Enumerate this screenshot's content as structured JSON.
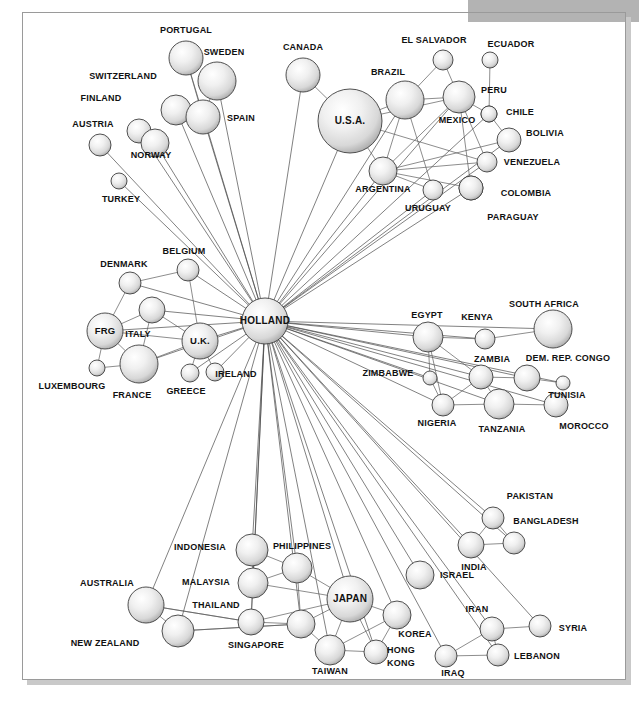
{
  "figure": {
    "type": "network-diagram",
    "title": "",
    "hub": "HOLLAND",
    "background": "#ffffff",
    "frame_color": "#9a9a9a",
    "banner_color": "#b3b3b3",
    "node_fill_light": "#ffffff",
    "node_fill_mid": "#e2e2e2",
    "node_fill_dark": "#b0b0b0",
    "node_stroke": "#3d3d3d",
    "edge_color": "#5c5c5c"
  },
  "banner": {
    "x": 468,
    "y": 0,
    "width": 171,
    "height": 22
  },
  "frame": {
    "x": 22,
    "y": 12,
    "width": 604,
    "height": 668
  },
  "nodes": [
    {
      "id": "portugal",
      "label": "PORTUGAL",
      "x": 186,
      "y": 58,
      "r": 17,
      "lx": 186,
      "ly": 33,
      "anchor": "middle",
      "inside": false
    },
    {
      "id": "sweden",
      "label": "SWEDEN",
      "x": 217,
      "y": 81,
      "r": 19,
      "lx": 224,
      "ly": 55,
      "anchor": "middle",
      "inside": false
    },
    {
      "id": "switzerland",
      "label": "SWITZERLAND",
      "x": 176,
      "y": 110,
      "r": 15,
      "lx": 123,
      "ly": 79,
      "anchor": "middle",
      "inside": false
    },
    {
      "id": "spain",
      "label": "SPAIN",
      "x": 203,
      "y": 117,
      "r": 17,
      "lx": 241,
      "ly": 121,
      "anchor": "middle",
      "inside": false
    },
    {
      "id": "finland",
      "label": "FINLAND",
      "x": 139,
      "y": 131,
      "r": 12,
      "lx": 101,
      "ly": 101,
      "anchor": "middle",
      "inside": false
    },
    {
      "id": "norway",
      "label": "NORWAY",
      "x": 155,
      "y": 143,
      "r": 14,
      "lx": 151,
      "ly": 158,
      "anchor": "middle",
      "inside": false
    },
    {
      "id": "austria",
      "label": "AUSTRIA",
      "x": 100,
      "y": 145,
      "r": 11,
      "lx": 93,
      "ly": 127,
      "anchor": "middle",
      "inside": false
    },
    {
      "id": "turkey",
      "label": "TURKEY",
      "x": 119,
      "y": 181,
      "r": 8,
      "lx": 121,
      "ly": 202,
      "anchor": "middle",
      "inside": false
    },
    {
      "id": "canada",
      "label": "CANADA",
      "x": 303,
      "y": 75,
      "r": 17,
      "lx": 303,
      "ly": 50,
      "anchor": "middle",
      "inside": false
    },
    {
      "id": "usa",
      "label": "U.S.A.",
      "x": 350,
      "y": 121,
      "r": 32,
      "lx": 350,
      "ly": 124,
      "anchor": "middle",
      "inside": true
    },
    {
      "id": "brazil",
      "label": "BRAZIL",
      "x": 405,
      "y": 100,
      "r": 19,
      "lx": 388,
      "ly": 75,
      "anchor": "middle",
      "inside": false
    },
    {
      "id": "elsalvador",
      "label": "EL SALVADOR",
      "x": 443,
      "y": 60,
      "r": 10,
      "lx": 434,
      "ly": 43,
      "anchor": "middle",
      "inside": false
    },
    {
      "id": "ecuador",
      "label": "ECUADOR",
      "x": 490,
      "y": 60,
      "r": 8,
      "lx": 511,
      "ly": 47,
      "anchor": "middle",
      "inside": false
    },
    {
      "id": "mexico",
      "label": "MEXICO",
      "x": 459,
      "y": 97,
      "r": 16,
      "lx": 457,
      "ly": 123,
      "anchor": "middle",
      "inside": false
    },
    {
      "id": "peru",
      "label": "PERU",
      "x": 489,
      "y": 114,
      "r": 8,
      "lx": 494,
      "ly": 93,
      "anchor": "middle",
      "inside": false
    },
    {
      "id": "chile",
      "label": "CHILE",
      "x": 489,
      "y": 114,
      "r": 8,
      "lx": 520,
      "ly": 115,
      "anchor": "middle",
      "inside": false
    },
    {
      "id": "bolivia",
      "label": "BOLIVIA",
      "x": 509,
      "y": 140,
      "r": 12,
      "lx": 545,
      "ly": 136,
      "anchor": "middle",
      "inside": false
    },
    {
      "id": "argentina",
      "label": "ARGENTINA",
      "x": 383,
      "y": 171,
      "r": 14,
      "lx": 383,
      "ly": 192,
      "anchor": "middle",
      "inside": false
    },
    {
      "id": "venezuela",
      "label": "VENEZUELA",
      "x": 487,
      "y": 162,
      "r": 10,
      "lx": 532,
      "ly": 165,
      "anchor": "middle",
      "inside": false
    },
    {
      "id": "uruguay",
      "label": "URUGUAY",
      "x": 433,
      "y": 190,
      "r": 10,
      "lx": 428,
      "ly": 211,
      "anchor": "middle",
      "inside": false
    },
    {
      "id": "paraguay",
      "label": "PARAGUAY",
      "x": 471,
      "y": 188,
      "r": 12,
      "lx": 513,
      "ly": 220,
      "anchor": "middle",
      "inside": false
    },
    {
      "id": "colombia",
      "label": "COLOMBIA",
      "x": 471,
      "y": 188,
      "r": 12,
      "lx": 526,
      "ly": 196,
      "anchor": "middle",
      "inside": false
    },
    {
      "id": "belgium",
      "label": "BELGIUM",
      "x": 188,
      "y": 270,
      "r": 11,
      "lx": 184,
      "ly": 254,
      "anchor": "middle",
      "inside": false
    },
    {
      "id": "denmark",
      "label": "DENMARK",
      "x": 130,
      "y": 283,
      "r": 11,
      "lx": 124,
      "ly": 267,
      "anchor": "middle",
      "inside": false
    },
    {
      "id": "italy",
      "label": "ITALY",
      "x": 152,
      "y": 310,
      "r": 13,
      "lx": 138,
      "ly": 337,
      "anchor": "middle",
      "inside": false
    },
    {
      "id": "frg",
      "label": "FRG",
      "x": 105,
      "y": 331,
      "r": 18,
      "lx": 105,
      "ly": 334,
      "anchor": "middle",
      "inside": true
    },
    {
      "id": "uk",
      "label": "U.K.",
      "x": 200,
      "y": 341,
      "r": 18,
      "lx": 200,
      "ly": 344,
      "anchor": "middle",
      "inside": true
    },
    {
      "id": "holland",
      "label": "HOLLAND",
      "x": 265,
      "y": 321,
      "r": 23,
      "lx": 265,
      "ly": 324,
      "anchor": "middle",
      "inside": true
    },
    {
      "id": "france",
      "label": "FRANCE",
      "x": 139,
      "y": 364,
      "r": 19,
      "lx": 132,
      "ly": 398,
      "anchor": "middle",
      "inside": false
    },
    {
      "id": "luxembourg",
      "label": "LUXEMBOURG",
      "x": 97,
      "y": 368,
      "r": 8,
      "lx": 72,
      "ly": 389,
      "anchor": "middle",
      "inside": false
    },
    {
      "id": "greece",
      "label": "GREECE",
      "x": 190,
      "y": 373,
      "r": 9,
      "lx": 186,
      "ly": 394,
      "anchor": "middle",
      "inside": false
    },
    {
      "id": "ireland",
      "label": "IRELAND",
      "x": 215,
      "y": 372,
      "r": 9,
      "lx": 236,
      "ly": 377,
      "anchor": "middle",
      "inside": false
    },
    {
      "id": "egypt",
      "label": "EGYPT",
      "x": 428,
      "y": 337,
      "r": 15,
      "lx": 427,
      "ly": 318,
      "anchor": "middle",
      "inside": false
    },
    {
      "id": "kenya",
      "label": "KENYA",
      "x": 485,
      "y": 339,
      "r": 10,
      "lx": 477,
      "ly": 320,
      "anchor": "middle",
      "inside": false
    },
    {
      "id": "southafrica",
      "label": "SOUTH AFRICA",
      "x": 553,
      "y": 329,
      "r": 19,
      "lx": 544,
      "ly": 307,
      "anchor": "middle",
      "inside": false
    },
    {
      "id": "zambia",
      "label": "ZAMBIA",
      "x": 481,
      "y": 377,
      "r": 12,
      "lx": 492,
      "ly": 362,
      "anchor": "middle",
      "inside": false
    },
    {
      "id": "congo",
      "label": "DEM. REP. CONGO",
      "x": 527,
      "y": 378,
      "r": 13,
      "lx": 568,
      "ly": 361,
      "anchor": "middle",
      "inside": false
    },
    {
      "id": "zimbabwe",
      "label": "ZIMBABWE",
      "x": 430,
      "y": 378,
      "r": 7,
      "lx": 388,
      "ly": 376,
      "anchor": "middle",
      "inside": false
    },
    {
      "id": "tunisia",
      "label": "TUNISIA",
      "x": 563,
      "y": 383,
      "r": 7,
      "lx": 567,
      "ly": 398,
      "anchor": "middle",
      "inside": false
    },
    {
      "id": "nigeria",
      "label": "NIGERIA",
      "x": 443,
      "y": 405,
      "r": 11,
      "lx": 437,
      "ly": 426,
      "anchor": "middle",
      "inside": false
    },
    {
      "id": "tanzania",
      "label": "TANZANIA",
      "x": 499,
      "y": 404,
      "r": 15,
      "lx": 502,
      "ly": 432,
      "anchor": "middle",
      "inside": false
    },
    {
      "id": "morocco",
      "label": "MOROCCO",
      "x": 556,
      "y": 405,
      "r": 12,
      "lx": 584,
      "ly": 429,
      "anchor": "middle",
      "inside": false
    },
    {
      "id": "indonesia",
      "label": "INDONESIA",
      "x": 252,
      "y": 550,
      "r": 16,
      "lx": 200,
      "ly": 550,
      "anchor": "middle",
      "inside": false
    },
    {
      "id": "philippines",
      "label": "PHILIPPINES",
      "x": 297,
      "y": 568,
      "r": 15,
      "lx": 302,
      "ly": 549,
      "anchor": "middle",
      "inside": false
    },
    {
      "id": "malaysia",
      "label": "MALAYSIA",
      "x": 253,
      "y": 583,
      "r": 15,
      "lx": 206,
      "ly": 585,
      "anchor": "middle",
      "inside": false
    },
    {
      "id": "japan",
      "label": "JAPAN",
      "x": 350,
      "y": 599,
      "r": 23,
      "lx": 350,
      "ly": 602,
      "anchor": "middle",
      "inside": true
    },
    {
      "id": "australia",
      "label": "AUSTRALIA",
      "x": 146,
      "y": 605,
      "r": 18,
      "lx": 107,
      "ly": 586,
      "anchor": "middle",
      "inside": false
    },
    {
      "id": "thailand",
      "label": "THAILAND",
      "x": 251,
      "y": 622,
      "r": 13,
      "lx": 216,
      "ly": 608,
      "anchor": "middle",
      "inside": false
    },
    {
      "id": "newzealand",
      "label": "NEW ZEALAND",
      "x": 178,
      "y": 631,
      "r": 16,
      "lx": 105,
      "ly": 646,
      "anchor": "middle",
      "inside": false
    },
    {
      "id": "singapore",
      "label": "SINGAPORE",
      "x": 301,
      "y": 624,
      "r": 14,
      "lx": 256,
      "ly": 648,
      "anchor": "middle",
      "inside": false
    },
    {
      "id": "taiwan",
      "label": "TAIWAN",
      "x": 330,
      "y": 650,
      "r": 15,
      "lx": 330,
      "ly": 674,
      "anchor": "middle",
      "inside": false
    },
    {
      "id": "korea",
      "label": "KOREA",
      "x": 397,
      "y": 615,
      "r": 14,
      "lx": 415,
      "ly": 637,
      "anchor": "middle",
      "inside": false
    },
    {
      "id": "hongkong",
      "label": "HONG",
      "x": 376,
      "y": 652,
      "r": 12,
      "lx": 401,
      "ly": 653,
      "anchor": "middle",
      "inside": false
    },
    {
      "id": "hongkong2",
      "label": "KONG",
      "x": -99,
      "y": -99,
      "r": 0,
      "lx": 401,
      "ly": 666,
      "anchor": "middle",
      "inside": false
    },
    {
      "id": "pakistan",
      "label": "PAKISTAN",
      "x": 493,
      "y": 518,
      "r": 11,
      "lx": 530,
      "ly": 499,
      "anchor": "middle",
      "inside": false
    },
    {
      "id": "bangladesh",
      "label": "BANGLADESH",
      "x": 514,
      "y": 543,
      "r": 11,
      "lx": 546,
      "ly": 524,
      "anchor": "middle",
      "inside": false
    },
    {
      "id": "india",
      "label": "INDIA",
      "x": 471,
      "y": 545,
      "r": 13,
      "lx": 474,
      "ly": 570,
      "anchor": "middle",
      "inside": false
    },
    {
      "id": "israel",
      "label": "ISRAEL",
      "x": 420,
      "y": 575,
      "r": 14,
      "lx": 457,
      "ly": 578,
      "anchor": "middle",
      "inside": false
    },
    {
      "id": "iran",
      "label": "IRAN",
      "x": 492,
      "y": 629,
      "r": 12,
      "lx": 477,
      "ly": 612,
      "anchor": "middle",
      "inside": false
    },
    {
      "id": "syria",
      "label": "SYRIA",
      "x": 540,
      "y": 626,
      "r": 11,
      "lx": 573,
      "ly": 631,
      "anchor": "middle",
      "inside": false
    },
    {
      "id": "iraq",
      "label": "IRAQ",
      "x": 446,
      "y": 656,
      "r": 11,
      "lx": 453,
      "ly": 676,
      "anchor": "middle",
      "inside": false
    },
    {
      "id": "lebanon",
      "label": "LEBANON",
      "x": 498,
      "y": 655,
      "r": 11,
      "lx": 537,
      "ly": 659,
      "anchor": "middle",
      "inside": false
    }
  ],
  "edges": [
    [
      "holland",
      "portugal"
    ],
    [
      "holland",
      "sweden"
    ],
    [
      "holland",
      "switzerland"
    ],
    [
      "holland",
      "spain"
    ],
    [
      "holland",
      "finland"
    ],
    [
      "holland",
      "norway"
    ],
    [
      "holland",
      "austria"
    ],
    [
      "holland",
      "turkey"
    ],
    [
      "holland",
      "canada"
    ],
    [
      "holland",
      "usa"
    ],
    [
      "holland",
      "brazil"
    ],
    [
      "holland",
      "mexico"
    ],
    [
      "holland",
      "argentina"
    ],
    [
      "holland",
      "venezuela"
    ],
    [
      "holland",
      "uruguay"
    ],
    [
      "holland",
      "colombia"
    ],
    [
      "holland",
      "bolivia"
    ],
    [
      "holland",
      "peru"
    ],
    [
      "holland",
      "belgium"
    ],
    [
      "holland",
      "denmark"
    ],
    [
      "holland",
      "italy"
    ],
    [
      "holland",
      "frg"
    ],
    [
      "holland",
      "uk"
    ],
    [
      "holland",
      "france"
    ],
    [
      "holland",
      "greece"
    ],
    [
      "holland",
      "ireland"
    ],
    [
      "holland",
      "egypt"
    ],
    [
      "holland",
      "kenya"
    ],
    [
      "holland",
      "southafrica"
    ],
    [
      "holland",
      "zambia"
    ],
    [
      "holland",
      "congo"
    ],
    [
      "holland",
      "zimbabwe"
    ],
    [
      "holland",
      "tunisia"
    ],
    [
      "holland",
      "nigeria"
    ],
    [
      "holland",
      "tanzania"
    ],
    [
      "holland",
      "morocco"
    ],
    [
      "holland",
      "indonesia"
    ],
    [
      "holland",
      "philippines"
    ],
    [
      "holland",
      "malaysia"
    ],
    [
      "holland",
      "japan"
    ],
    [
      "holland",
      "australia"
    ],
    [
      "holland",
      "thailand"
    ],
    [
      "holland",
      "newzealand"
    ],
    [
      "holland",
      "singapore"
    ],
    [
      "holland",
      "taiwan"
    ],
    [
      "holland",
      "korea"
    ],
    [
      "holland",
      "hongkong"
    ],
    [
      "holland",
      "pakistan"
    ],
    [
      "holland",
      "bangladesh"
    ],
    [
      "holland",
      "india"
    ],
    [
      "holland",
      "israel"
    ],
    [
      "holland",
      "iran"
    ],
    [
      "holland",
      "syria"
    ],
    [
      "holland",
      "iraq"
    ],
    [
      "holland",
      "lebanon"
    ],
    [
      "portugal",
      "spain"
    ],
    [
      "sweden",
      "spain"
    ],
    [
      "switzerland",
      "spain"
    ],
    [
      "finland",
      "norway"
    ],
    [
      "usa",
      "canada"
    ],
    [
      "usa",
      "brazil"
    ],
    [
      "usa",
      "mexico"
    ],
    [
      "usa",
      "argentina"
    ],
    [
      "usa",
      "venezuela"
    ],
    [
      "brazil",
      "elsalvador"
    ],
    [
      "brazil",
      "argentina"
    ],
    [
      "brazil",
      "mexico"
    ],
    [
      "brazil",
      "uruguay"
    ],
    [
      "mexico",
      "elsalvador"
    ],
    [
      "mexico",
      "peru"
    ],
    [
      "mexico",
      "argentina"
    ],
    [
      "mexico",
      "venezuela"
    ],
    [
      "mexico",
      "colombia"
    ],
    [
      "ecuador",
      "peru"
    ],
    [
      "peru",
      "bolivia"
    ],
    [
      "argentina",
      "venezuela"
    ],
    [
      "argentina",
      "uruguay"
    ],
    [
      "argentina",
      "bolivia"
    ],
    [
      "argentina",
      "colombia"
    ],
    [
      "frg",
      "italy"
    ],
    [
      "frg",
      "denmark"
    ],
    [
      "frg",
      "france"
    ],
    [
      "frg",
      "uk"
    ],
    [
      "frg",
      "luxembourg"
    ],
    [
      "france",
      "luxembourg"
    ],
    [
      "france",
      "italy"
    ],
    [
      "france",
      "uk"
    ],
    [
      "uk",
      "belgium"
    ],
    [
      "uk",
      "greece"
    ],
    [
      "uk",
      "ireland"
    ],
    [
      "uk",
      "italy"
    ],
    [
      "denmark",
      "belgium"
    ],
    [
      "egypt",
      "kenya"
    ],
    [
      "egypt",
      "zambia"
    ],
    [
      "egypt",
      "nigeria"
    ],
    [
      "egypt",
      "zimbabwe"
    ],
    [
      "kenya",
      "southafrica"
    ],
    [
      "zambia",
      "congo"
    ],
    [
      "zambia",
      "nigeria"
    ],
    [
      "zambia",
      "tanzania"
    ],
    [
      "zimbabwe",
      "nigeria"
    ],
    [
      "nigeria",
      "tanzania"
    ],
    [
      "tanzania",
      "morocco"
    ],
    [
      "congo",
      "tunisia"
    ],
    [
      "japan",
      "korea"
    ],
    [
      "japan",
      "taiwan"
    ],
    [
      "japan",
      "hongkong"
    ],
    [
      "japan",
      "philippines"
    ],
    [
      "japan",
      "singapore"
    ],
    [
      "japan",
      "malaysia"
    ],
    [
      "japan",
      "thailand"
    ],
    [
      "indonesia",
      "malaysia"
    ],
    [
      "indonesia",
      "philippines"
    ],
    [
      "malaysia",
      "thailand"
    ],
    [
      "malaysia",
      "philippines"
    ],
    [
      "philippines",
      "singapore"
    ],
    [
      "thailand",
      "singapore"
    ],
    [
      "thailand",
      "australia"
    ],
    [
      "singapore",
      "newzealand"
    ],
    [
      "singapore",
      "taiwan"
    ],
    [
      "australia",
      "newzealand"
    ],
    [
      "australia",
      "thailand"
    ],
    [
      "newzealand",
      "singapore"
    ],
    [
      "taiwan",
      "hongkong"
    ],
    [
      "taiwan",
      "korea"
    ],
    [
      "korea",
      "hongkong"
    ],
    [
      "pakistan",
      "bangladesh"
    ],
    [
      "pakistan",
      "india"
    ],
    [
      "india",
      "bangladesh"
    ],
    [
      "iran",
      "iraq"
    ],
    [
      "iran",
      "syria"
    ],
    [
      "iran",
      "lebanon"
    ],
    [
      "iraq",
      "lebanon"
    ]
  ]
}
